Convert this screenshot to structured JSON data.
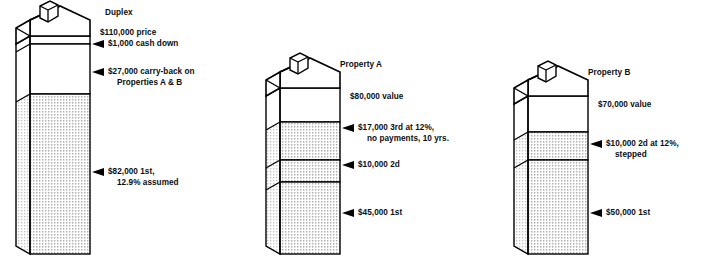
{
  "figure": {
    "type": "diagram",
    "subtype": "real-estate-financing-stack",
    "background_color": "#ffffff",
    "ink_color": "#000000",
    "fill_pattern": "dotted-stipple",
    "white_fill": "#ffffff"
  },
  "properties": [
    {
      "id": "duplex",
      "title": "Duplex",
      "value_label": "$110,000 price",
      "layers": [
        {
          "id": "cash-down",
          "label": "$1,000 cash down",
          "label2": "",
          "fill": "white",
          "arrow": true
        },
        {
          "id": "carry-back",
          "label": "$27,000 carry-back on",
          "label2": "Properties A & B",
          "fill": "white",
          "arrow": true
        },
        {
          "id": "first",
          "label": "$82,000 1st,",
          "label2": "12.9% assumed",
          "fill": "dotted",
          "arrow": true
        }
      ]
    },
    {
      "id": "property-a",
      "title": "Property A",
      "value_label": "$80,000 value",
      "layers": [
        {
          "id": "third",
          "label": "$17,000 3rd at 12%,",
          "label2": "no payments, 10 yrs.",
          "fill": "dotted",
          "arrow": true
        },
        {
          "id": "second",
          "label": "$10,000 2d",
          "label2": "",
          "fill": "dotted",
          "arrow": true
        },
        {
          "id": "first",
          "label": "$45,000 1st",
          "label2": "",
          "fill": "dotted",
          "arrow": true
        }
      ]
    },
    {
      "id": "property-b",
      "title": "Property B",
      "value_label": "$70,000 value",
      "layers": [
        {
          "id": "second",
          "label": "$10,000 2d at 12%,",
          "label2": "stepped",
          "fill": "dotted",
          "arrow": true
        },
        {
          "id": "first",
          "label": "$50,000 1st",
          "label2": "",
          "fill": "dotted",
          "arrow": true
        }
      ]
    }
  ],
  "icons": {
    "arrow": "left-pointing-triangle-marker",
    "building": "house-with-chimney-block",
    "chimney": "chimney-icon"
  }
}
